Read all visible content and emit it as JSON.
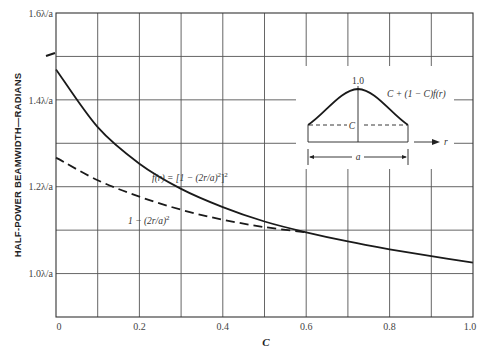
{
  "chart_data": {
    "type": "line",
    "title": "",
    "xlabel": "C",
    "ylabel": "HALF-POWER BEAMWIDTH—RADIANS",
    "xlim": [
      0,
      1.0
    ],
    "ylim": [
      0.9,
      1.6
    ],
    "grid": true,
    "x_ticks": [
      0,
      0.2,
      0.4,
      0.6,
      0.8,
      1.0
    ],
    "x_tick_labels": [
      "0",
      "0.2",
      "0.4",
      "0.6",
      "0.8",
      "1.0"
    ],
    "y_ticks": [
      1.0,
      1.2,
      1.4,
      1.6
    ],
    "y_tick_labels": [
      "1.0λ/a",
      "1.2λ/a",
      "1.4λ/a",
      "1.6λ/a"
    ],
    "x": [
      0,
      0.1,
      0.2,
      0.3,
      0.4,
      0.5,
      0.6,
      0.7,
      0.8,
      0.9,
      1.0
    ],
    "series": [
      {
        "name": "f(r) = [1 − (2r/a)²]²",
        "style": "solid",
        "values": [
          1.47,
          1.337,
          1.253,
          1.195,
          1.153,
          1.12,
          1.095,
          1.074,
          1.056,
          1.04,
          1.025
        ]
      },
      {
        "name": "1 − (2r/a)²",
        "style": "dashed",
        "x": [
          0,
          0.1,
          0.2,
          0.3,
          0.4,
          0.5,
          0.6
        ],
        "values": [
          1.267,
          1.215,
          1.177,
          1.147,
          1.124,
          1.107,
          1.095
        ]
      }
    ],
    "annotations": [
      "f(r) = [1 − (2r/a)²]²",
      "1 − (2r/a)²",
      "Inset: aperture illumination C + (1 − C)f(r), peak 1.0, edge level C, width a, axis r"
    ]
  },
  "labels": {
    "y_axis_title": "HALF-POWER BEAMWIDTH—RADIANS",
    "x_axis_title": "C",
    "y_ticks": [
      "1.6λ/a",
      "1.4λ/a",
      "1.2λ/a",
      "1.0λ/a"
    ],
    "x_ticks": [
      "0",
      "0.2",
      "0.4",
      "0.6",
      "0.8",
      "1.0"
    ],
    "solid_curve_label_prefix": "f(r) = [1 − (2r/a)",
    "solid_curve_label_sup": "2",
    "solid_curve_label_close": "]",
    "solid_curve_label_sup2": "2",
    "dashed_curve_label": "1 − (2r/a)",
    "dashed_curve_label_sup": "2"
  },
  "inset": {
    "peak_label": "1.0",
    "formula": "C + (1 − C)f(r)",
    "edge_label": "C",
    "width_label": "a",
    "axis_label": "r"
  }
}
